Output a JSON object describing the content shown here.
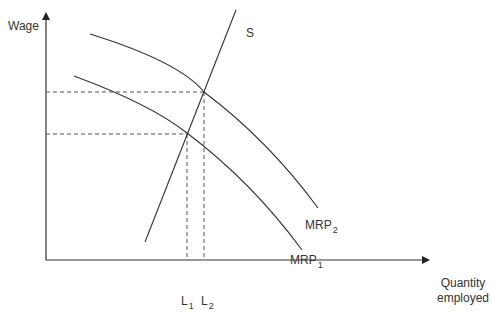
{
  "diagram": {
    "type": "labour-market-mrp-shift",
    "axes": {
      "y_label": "Wage",
      "x_label_line1": "Quantity",
      "x_label_line2": "employed"
    },
    "curves": {
      "supply": {
        "label": "S"
      },
      "mrp1": {
        "label_main": "MRP",
        "label_sub": "1"
      },
      "mrp2": {
        "label_main": "MRP",
        "label_sub": "2"
      }
    },
    "equilibria": {
      "l1": {
        "label_main": "L",
        "label_sub": "1"
      },
      "l2": {
        "label_main": "L",
        "label_sub": "2"
      }
    },
    "colors": {
      "line": "#333333",
      "dashed": "#444444",
      "background": "#ffffff"
    }
  }
}
